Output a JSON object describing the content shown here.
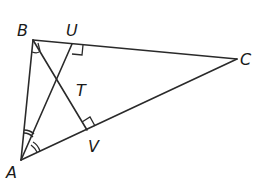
{
  "diagram": {
    "type": "triangle-geometry",
    "points": {
      "A": {
        "label": "A",
        "x": 21,
        "y": 160
      },
      "B": {
        "label": "B",
        "x": 33,
        "y": 40
      },
      "C": {
        "label": "C",
        "x": 237,
        "y": 59
      },
      "U": {
        "label": "U",
        "x": 72,
        "y": 44
      },
      "V": {
        "label": "V",
        "x": 87,
        "y": 130
      },
      "T": {
        "label": "T",
        "x": 68,
        "y": 92
      }
    },
    "segments": [
      "AB",
      "BC",
      "CA",
      "BV",
      "AU"
    ],
    "markings": {
      "right_angles": [
        "U",
        "V"
      ],
      "angle_bisector_arcs": {
        "vertex_A": "double-arc",
        "vertex_B": "single-arc"
      }
    }
  },
  "labels": {
    "A": "A",
    "B": "B",
    "C": "C",
    "U": "U",
    "V": "V",
    "T": "T"
  }
}
